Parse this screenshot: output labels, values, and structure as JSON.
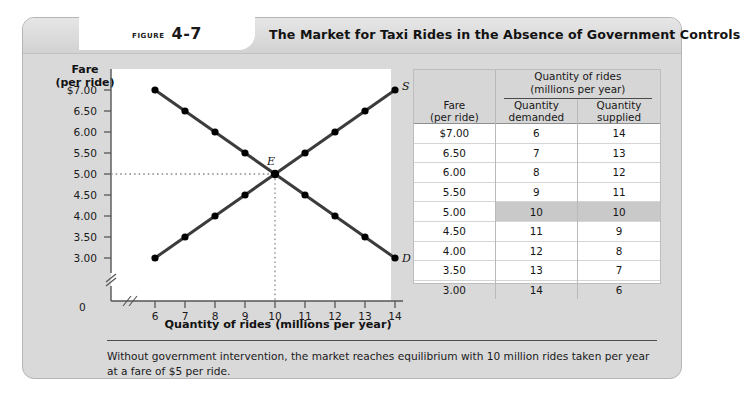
{
  "figure": {
    "label_word": "Figure",
    "number": "4-7",
    "title": "The Market for Taxi Rides in the Absence of Government Controls",
    "caption": "Without government intervention, the market reaches equilibrium with 10 million rides taken per year at a fare of $5 per ride."
  },
  "table": {
    "col_fare_line1": "Fare",
    "col_fare_line2": "(per ride)",
    "span_header_line1": "Quantity of rides",
    "span_header_line2": "(millions per year)",
    "col_demanded_line1": "Quantity",
    "col_demanded_line2": "demanded",
    "col_supplied_line1": "Quantity",
    "col_supplied_line2": "supplied",
    "rows": [
      {
        "fare": "$7.00",
        "demanded": "6",
        "supplied": "14",
        "highlight": false
      },
      {
        "fare": "6.50",
        "demanded": "7",
        "supplied": "13",
        "highlight": false
      },
      {
        "fare": "6.00",
        "demanded": "8",
        "supplied": "12",
        "highlight": false
      },
      {
        "fare": "5.50",
        "demanded": "9",
        "supplied": "11",
        "highlight": false
      },
      {
        "fare": "5.00",
        "demanded": "10",
        "supplied": "10",
        "highlight": true
      },
      {
        "fare": "4.50",
        "demanded": "11",
        "supplied": "9",
        "highlight": false
      },
      {
        "fare": "4.00",
        "demanded": "12",
        "supplied": "8",
        "highlight": false
      },
      {
        "fare": "3.50",
        "demanded": "13",
        "supplied": "7",
        "highlight": false
      },
      {
        "fare": "3.00",
        "demanded": "14",
        "supplied": "6",
        "highlight": false
      }
    ]
  },
  "chart_data": {
    "type": "line",
    "title": "The Market for Taxi Rides in the Absence of Government Controls",
    "xlabel": "Quantity of rides (millions per year)",
    "ylabel_line1": "Fare",
    "ylabel_line2": "(per ride)",
    "x": [
      6,
      7,
      8,
      9,
      10,
      11,
      12,
      13,
      14
    ],
    "xlim": [
      6,
      14
    ],
    "ylim": [
      3.0,
      7.0
    ],
    "xticks": [
      "6",
      "7",
      "8",
      "9",
      "10",
      "11",
      "12",
      "13",
      "14"
    ],
    "yticks": [
      "$7.00",
      "6.50",
      "6.00",
      "5.50",
      "5.00",
      "4.50",
      "4.00",
      "3.50",
      "3.00"
    ],
    "ytick_values": [
      7.0,
      6.5,
      6.0,
      5.5,
      5.0,
      4.5,
      4.0,
      3.5,
      3.0
    ],
    "origin_label": "0",
    "axis_break": true,
    "grid": false,
    "series": [
      {
        "name": "D",
        "label": "D",
        "description": "Demand curve",
        "values": [
          7.0,
          6.5,
          6.0,
          5.5,
          5.0,
          4.5,
          4.0,
          3.5,
          3.0
        ]
      },
      {
        "name": "S",
        "label": "S",
        "description": "Supply curve",
        "values": [
          3.0,
          3.5,
          4.0,
          4.5,
          5.0,
          5.5,
          6.0,
          6.5,
          7.0
        ]
      }
    ],
    "annotations": [
      {
        "label": "E",
        "x": 10,
        "y": 5.0,
        "description": "Equilibrium point"
      }
    ],
    "equilibrium": {
      "quantity": 10,
      "fare": 5.0,
      "label": "E"
    },
    "colors": {
      "curve": "#3b3b3b",
      "marker": "#000000",
      "guide": "#8a8a8a"
    }
  }
}
